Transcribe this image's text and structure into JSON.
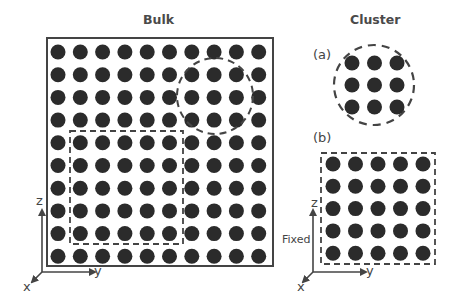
{
  "titles": {
    "bulk": "Bulk",
    "cluster": "Cluster"
  },
  "panel_labels": {
    "a": "(a)",
    "b": "(b)"
  },
  "axes": {
    "z": "z",
    "y": "y",
    "x": "x"
  },
  "fixed_label": "Fixed",
  "colors": {
    "atom": "#2b2b2b",
    "line": "#444444",
    "text": "#444444"
  },
  "bulk_lattice": {
    "rows": 10,
    "cols": 10
  },
  "cluster_a_lattice": {
    "rows": 3,
    "cols": 3,
    "boundary": "dashed-circle"
  },
  "cluster_b_lattice": {
    "rows": 5,
    "cols": 5,
    "boundary": "dashed-square"
  }
}
